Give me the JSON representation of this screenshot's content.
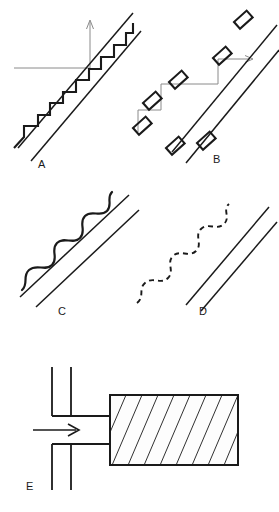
{
  "figure": {
    "title": "",
    "width": 279,
    "height": 512,
    "background_color": "#ffffff",
    "stroke_color": "#1a1a1a",
    "guide_color": "#8a8a8a",
    "panel_count": 5
  },
  "panels": [
    {
      "id": "A",
      "label": "A",
      "label_x": 38,
      "label_y": 168,
      "description": "staircase stepped interface along an inclined double line",
      "interface_style": "continuous-step",
      "axis": {
        "type": "corner-axes",
        "vertical_arrow": "up",
        "horizontal_arrow": "none",
        "origin_x": 90,
        "origin_y": 68,
        "vertical_tip_y": 20,
        "horizontal_start_x": 14
      },
      "rails": {
        "upper_x1": 18,
        "upper_y1": 148,
        "upper_x2": 132,
        "upper_y2": 14,
        "lower_x1": 30,
        "lower_y1": 160,
        "lower_x2": 140,
        "lower_y2": 30
      },
      "steps": 7
    },
    {
      "id": "B",
      "label": "B",
      "label_x": 213,
      "label_y": 163,
      "description": "detached tilted blocks arranged along a stepped path beside an inclined double line",
      "interface_style": "detached-blocks",
      "axis": {
        "type": "corner-axes",
        "vertical_arrow": "none",
        "horizontal_arrow": "right",
        "origin_x": 218,
        "origin_y": 60,
        "horizontal_tip_x": 252,
        "corner_x": 213,
        "corner_y": 83,
        "low_corner_x": 160,
        "low_corner_y": 110
      },
      "rails": {
        "upper_x1": 172,
        "upper_y1": 152,
        "upper_x2": 276,
        "upper_y2": 26,
        "lower_x1": 186,
        "lower_y1": 162,
        "lower_x2": 279,
        "lower_y2": 48
      },
      "block_count": 7
    },
    {
      "id": "C",
      "label": "C",
      "label_x": 58,
      "label_y": 315,
      "description": "smooth continuous wavy interface along an inclined double line",
      "interface_style": "solid-wave",
      "rails": {
        "upper_x1": 20,
        "upper_y1": 296,
        "upper_x2": 128,
        "upper_y2": 196,
        "lower_x1": 36,
        "lower_y1": 306,
        "lower_x2": 138,
        "lower_y2": 210
      },
      "wave_amplitude": 7,
      "wave_cycles": 4
    },
    {
      "id": "D",
      "label": "D",
      "label_x": 199,
      "label_y": 315,
      "description": "dashed wavy interface along an inclined double line",
      "interface_style": "dashed-wave",
      "rails": {
        "upper_x1": 186,
        "upper_y1": 304,
        "upper_x2": 268,
        "upper_y2": 208,
        "lower_x1": 200,
        "lower_y1": 310,
        "lower_x2": 276,
        "lower_y2": 222
      },
      "wave_amplitude": 7,
      "wave_cycles": 4,
      "dash_pattern": "5 4"
    },
    {
      "id": "E",
      "label": "E",
      "label_x": 26,
      "label_y": 490,
      "description": "inlet channel with flow arrow feeding a diagonally hatched block",
      "inlet_arrow": {
        "direction": "right",
        "x1": 33,
        "y1": 430,
        "x2": 78,
        "y2": 430
      },
      "channel": {
        "top_y": 415,
        "bottom_y": 443,
        "left_x": 78,
        "right_x": 110
      },
      "walls": {
        "wall_a_x": 78,
        "wall_b_x": 96,
        "top_y": 367,
        "bottom_y": 490
      },
      "block": {
        "x": 110,
        "y": 395,
        "width": 128,
        "height": 70,
        "hatch": "diagonal",
        "hatch_lines": 9,
        "fill": "#fdfdfd"
      }
    }
  ]
}
